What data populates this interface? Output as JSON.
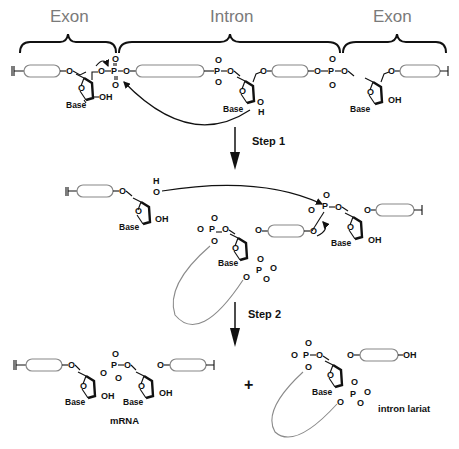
{
  "figure": {
    "regions": {
      "exon_left": "Exon",
      "intron": "Intron",
      "exon_right": "Exon"
    },
    "steps": {
      "step1": "Step 1",
      "step2": "Step 2"
    },
    "atoms": {
      "O": "O",
      "P": "P",
      "H": "H",
      "OH": "OH",
      "base": "Base"
    },
    "products": {
      "mrna": "mRNA",
      "plus": "+",
      "lariat": "intron lariat"
    },
    "colors": {
      "region_label": "#7a7a7a",
      "line": "#111111",
      "rna_segment": "#888888",
      "lariat_loop": "#8a8a8a"
    }
  }
}
